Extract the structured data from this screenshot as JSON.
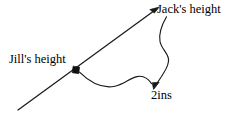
{
  "diagram": {
    "background_color": "#ffffff",
    "stroke_color": "#1a1a1a",
    "text_color": "#000000",
    "width": 234,
    "height": 117,
    "labels": {
      "jacks_height": "Jack's height",
      "jills_height": "Jill's height",
      "measurement": "2ins"
    },
    "elements": {
      "height_axis_line": {
        "name": "diagonal height line",
        "from": [
          18,
          110
        ],
        "to": [
          158,
          8
        ],
        "arrow_at": "to"
      },
      "jill_marker": {
        "name": "square point marker on line",
        "position": [
          76,
          70
        ],
        "size": 6,
        "filled": true
      },
      "jill_connector": {
        "name": "wavy leader curve from Jill marker toward measurement",
        "from": [
          79,
          71
        ],
        "to": [
          150,
          84
        ]
      },
      "jack_connector": {
        "name": "S-shaped leader curve from Jack label down to measurement arrow",
        "from": [
          166,
          17
        ],
        "to": [
          156,
          88
        ],
        "arrow_at": "to"
      }
    }
  }
}
